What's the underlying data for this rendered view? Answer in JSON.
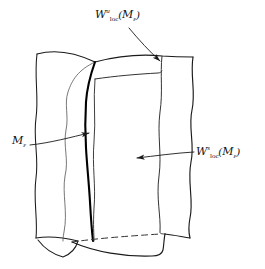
{
  "figure": {
    "kind": "mathematical-manifold-diagram",
    "width": 265,
    "height": 269,
    "background_color": "#ffffff",
    "stroke_color": "#1a1a1a",
    "thin_stroke_color": "#3a3a3a",
    "bold_stroke_color": "#000000"
  },
  "labels": {
    "unstable": {
      "full_text": "W^u_loc(M_e)",
      "letter": "W",
      "superscript": "u",
      "subscript": "loc",
      "open_paren": "(",
      "manifold": "M",
      "manifold_subscript": "ε",
      "close_paren": ")"
    },
    "stable": {
      "full_text": "W^s_loc(M_e)",
      "letter": "W",
      "superscript": "s",
      "subscript": "loc",
      "open_paren": "(",
      "manifold": "M",
      "manifold_subscript": "ε",
      "close_paren": ")"
    },
    "slow_manifold": {
      "full_text": "M_e",
      "manifold": "M",
      "manifold_subscript": "ε"
    }
  },
  "annotations": {
    "arrow_unstable": {
      "name": "arrow-to-unstable-sheet",
      "from": [
        129,
        28
      ],
      "to": [
        163,
        64
      ]
    },
    "arrow_stable": {
      "name": "arrow-to-stable-sheet",
      "from": [
        196,
        152
      ],
      "to": [
        133,
        158
      ]
    },
    "arrow_slow_manifold": {
      "name": "arrow-to-slow-manifold",
      "from": [
        30,
        145
      ],
      "to": [
        93,
        132
      ]
    }
  }
}
